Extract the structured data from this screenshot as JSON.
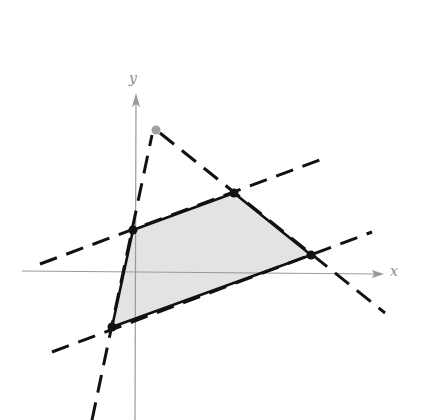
{
  "diagram": {
    "type": "feasible-region-graph",
    "axes": {
      "x_label": "x",
      "y_label": "y",
      "color": "#9a9a9a"
    },
    "region": {
      "fill": "#e3e3e3",
      "stroke": "#111111",
      "vertices_px": [
        [
          133,
          230
        ],
        [
          234,
          193
        ],
        [
          311,
          255
        ],
        [
          112,
          327
        ]
      ]
    },
    "boundary_lines_dashed": [
      {
        "name": "upper-line",
        "from": [
          40,
          264
        ],
        "to": [
          325,
          158
        ]
      },
      {
        "name": "lower-line",
        "from": [
          52,
          352
        ],
        "to": [
          372,
          232
        ]
      },
      {
        "name": "left-steep-line",
        "from": [
          92,
          420
        ],
        "to": [
          152,
          135
        ]
      },
      {
        "name": "right-descending-line",
        "from": [
          160,
          133
        ],
        "to": [
          385,
          313
        ]
      }
    ],
    "extra_point": {
      "px": [
        156,
        130
      ],
      "color": "#a0a0a0"
    }
  }
}
